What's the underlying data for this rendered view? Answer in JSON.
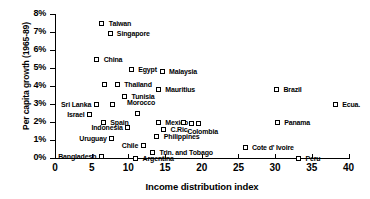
{
  "chart_data": {
    "type": "scatter",
    "title": "",
    "xlabel": "Income distribution index",
    "ylabel": "Per capita growth (1965-89)",
    "xlim": [
      0,
      40
    ],
    "ylim": [
      0,
      8
    ],
    "grid": false,
    "legend": "none",
    "xticks": [
      "0",
      "5",
      "10",
      "15",
      "20",
      "25",
      "30",
      "35",
      "40"
    ],
    "xtick_values": [
      0,
      5,
      10,
      15,
      20,
      25,
      30,
      35,
      40
    ],
    "yticks": [
      "0%",
      "1%",
      "2%",
      "3%",
      "4%",
      "5%",
      "6%",
      "7%",
      "8%"
    ],
    "ytick_values": [
      0,
      1,
      2,
      3,
      4,
      5,
      6,
      7,
      8
    ],
    "points": [
      {
        "name": "Taiwan",
        "x": 6.4,
        "y": 7.5,
        "label": "Taiwan",
        "lx": 7.4,
        "ly": 7.5,
        "anchor": "left"
      },
      {
        "name": "Singapore",
        "x": 7.5,
        "y": 6.9,
        "label": "Singapore",
        "lx": 8.5,
        "ly": 6.9,
        "anchor": "left"
      },
      {
        "name": "China",
        "x": 5.7,
        "y": 5.5,
        "label": "China",
        "lx": 6.7,
        "ly": 5.5,
        "anchor": "left"
      },
      {
        "name": "Egypt",
        "x": 10.4,
        "y": 4.9,
        "label": "Egypt",
        "lx": 11.4,
        "ly": 4.9,
        "anchor": "left"
      },
      {
        "name": "Malaysia",
        "x": 14.6,
        "y": 4.8,
        "label": "Malaysia",
        "lx": 15.6,
        "ly": 4.8,
        "anchor": "left"
      },
      {
        "name": "Unlabeled-1",
        "x": 6.7,
        "y": 4.1,
        "label": "",
        "lx": 0,
        "ly": 0,
        "anchor": "none"
      },
      {
        "name": "Thailand",
        "x": 8.5,
        "y": 4.1,
        "label": "Thailand",
        "lx": 9.5,
        "ly": 4.1,
        "anchor": "left"
      },
      {
        "name": "Mauritius",
        "x": 14.1,
        "y": 3.8,
        "label": "Mauritius",
        "lx": 15.1,
        "ly": 3.8,
        "anchor": "left"
      },
      {
        "name": "Tunisia",
        "x": 9.5,
        "y": 3.4,
        "label": "Tunisia",
        "lx": 10.5,
        "ly": 3.4,
        "anchor": "left"
      },
      {
        "name": "Brazil",
        "x": 30.2,
        "y": 3.8,
        "label": "Brazil",
        "lx": 31.2,
        "ly": 3.8,
        "anchor": "left"
      },
      {
        "name": "Sri Lanka",
        "x": 5.6,
        "y": 3.0,
        "label": "Sri Lanka",
        "lx": 4.8,
        "ly": 3.0,
        "anchor": "right"
      },
      {
        "name": "Unlabeled-2",
        "x": 7.8,
        "y": 3.0,
        "label": "",
        "lx": 0,
        "ly": 0,
        "anchor": "none"
      },
      {
        "name": "Morocco",
        "x": 11.2,
        "y": 2.5,
        "label": "Morocco",
        "lx": 11.2,
        "ly": 3.1,
        "anchor": "center"
      },
      {
        "name": "Ecuador",
        "x": 38.2,
        "y": 3.0,
        "label": "Ecua.",
        "lx": 39.2,
        "ly": 3.0,
        "anchor": "left"
      },
      {
        "name": "Israel",
        "x": 4.7,
        "y": 2.4,
        "label": "Israel",
        "lx": 3.9,
        "ly": 2.4,
        "anchor": "right"
      },
      {
        "name": "Spain",
        "x": 6.6,
        "y": 2.0,
        "label": "Spain",
        "lx": 7.6,
        "ly": 2.0,
        "anchor": "left"
      },
      {
        "name": "Mexico",
        "x": 14.1,
        "y": 2.0,
        "label": "Mexico",
        "lx": 15.1,
        "ly": 2.0,
        "anchor": "left"
      },
      {
        "name": "Colombia-a",
        "x": 17.5,
        "y": 2.0,
        "label": "",
        "lx": 0,
        "ly": 0,
        "anchor": "none"
      },
      {
        "name": "Colombia-b",
        "x": 18.6,
        "y": 1.9,
        "label": "",
        "lx": 0,
        "ly": 0,
        "anchor": "none"
      },
      {
        "name": "Colombia",
        "x": 19.5,
        "y": 1.9,
        "label": "Colombia",
        "lx": 18.1,
        "ly": 1.5,
        "anchor": "left"
      },
      {
        "name": "Panama",
        "x": 30.3,
        "y": 2.0,
        "label": "Panama",
        "lx": 31.3,
        "ly": 2.0,
        "anchor": "left"
      },
      {
        "name": "Costa Rica",
        "x": 14.8,
        "y": 1.6,
        "label": "C.Ric.",
        "lx": 15.8,
        "ly": 1.6,
        "anchor": "left"
      },
      {
        "name": "Indonesia",
        "x": 9.9,
        "y": 1.7,
        "label": "Indonesia",
        "lx": 9.1,
        "ly": 1.7,
        "anchor": "right"
      },
      {
        "name": "Philippines",
        "x": 13.9,
        "y": 1.2,
        "label": "Philippines",
        "lx": 14.9,
        "ly": 1.2,
        "anchor": "left"
      },
      {
        "name": "Uruguay",
        "x": 7.7,
        "y": 1.1,
        "label": "Uruguay",
        "lx": 6.9,
        "ly": 1.1,
        "anchor": "right"
      },
      {
        "name": "Chile",
        "x": 12.0,
        "y": 0.7,
        "label": "Chile",
        "lx": 11.2,
        "ly": 0.7,
        "anchor": "right"
      },
      {
        "name": "Trinidad Tobago",
        "x": 13.3,
        "y": 0.3,
        "label": "Trin. and Tobago",
        "lx": 14.3,
        "ly": 0.3,
        "anchor": "left"
      },
      {
        "name": "Bangladesh",
        "x": 6.3,
        "y": 0.1,
        "label": "Bangladesh",
        "lx": 5.5,
        "ly": 0.1,
        "anchor": "right"
      },
      {
        "name": "Cote d Ivoire",
        "x": 25.9,
        "y": 0.6,
        "label": "Cote d' Ivoire",
        "lx": 26.9,
        "ly": 0.6,
        "anchor": "left"
      },
      {
        "name": "Argentina",
        "x": 11.0,
        "y": 0.0,
        "label": "Argentina",
        "lx": 12.0,
        "ly": 0.0,
        "anchor": "left"
      },
      {
        "name": "Peru",
        "x": 33.2,
        "y": 0.0,
        "label": "Peru",
        "lx": 34.2,
        "ly": 0.0,
        "anchor": "left"
      }
    ]
  }
}
